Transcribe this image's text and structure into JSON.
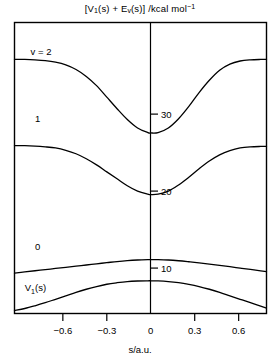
{
  "chart_data": {
    "type": "line",
    "title_parts": {
      "open_bracket": "[V",
      "sub1": "1",
      "mid": "(s) + E",
      "sub2": "v",
      "close": "(s)] /kcal mol",
      "sup": "−1"
    },
    "xlabel": "s/a.u.",
    "ylabel": "",
    "xlim": [
      -0.93,
      0.79
    ],
    "ylim": [
      4.1,
      41.9
    ],
    "grid": false,
    "legend_position": "inline-left-labels",
    "xticks": [
      -0.6,
      -0.3,
      0,
      0.3,
      0.6
    ],
    "xticklabels": [
      "−0.6",
      "−0.3",
      "0",
      "0.3",
      "0.6"
    ],
    "yticks": [
      10,
      20,
      30
    ],
    "yticklabels": [
      "10",
      "20",
      "30"
    ],
    "series": [
      {
        "name": "v = 2",
        "label": "v = 2",
        "label_x": -0.82,
        "label_y": 37.7,
        "x": [
          -0.93,
          -0.86,
          -0.79,
          -0.72,
          -0.65,
          -0.58,
          -0.51,
          -0.44,
          -0.37,
          -0.3,
          -0.23,
          -0.16,
          -0.09,
          -0.02,
          0.0,
          0.05,
          0.12,
          0.19,
          0.26,
          0.33,
          0.4,
          0.47,
          0.54,
          0.61,
          0.68,
          0.75,
          0.79
        ],
        "y": [
          37.1,
          37.1,
          37.05,
          36.95,
          36.75,
          36.4,
          35.8,
          34.9,
          33.7,
          32.2,
          30.7,
          29.3,
          28.2,
          27.6,
          27.55,
          27.6,
          28.2,
          29.4,
          31.0,
          32.8,
          34.4,
          35.7,
          36.5,
          36.9,
          37.05,
          37.1,
          37.1
        ]
      },
      {
        "name": "v = 1",
        "label": "1",
        "label_x": -0.79,
        "label_y": 29.0,
        "x": [
          -0.93,
          -0.86,
          -0.79,
          -0.72,
          -0.65,
          -0.58,
          -0.51,
          -0.44,
          -0.37,
          -0.3,
          -0.23,
          -0.16,
          -0.09,
          -0.02,
          0.0,
          0.05,
          0.12,
          0.19,
          0.26,
          0.33,
          0.4,
          0.47,
          0.54,
          0.61,
          0.68,
          0.75,
          0.79
        ],
        "y": [
          25.9,
          25.9,
          25.85,
          25.75,
          25.6,
          25.3,
          24.85,
          24.2,
          23.4,
          22.5,
          21.6,
          20.7,
          20.0,
          19.6,
          19.55,
          19.6,
          20.0,
          20.8,
          21.8,
          22.9,
          23.9,
          24.7,
          25.25,
          25.6,
          25.75,
          25.8,
          25.8
        ]
      },
      {
        "name": "v = 0",
        "label": "0",
        "label_x": -0.79,
        "label_y": 12.3,
        "x": [
          -0.93,
          -0.86,
          -0.79,
          -0.72,
          -0.65,
          -0.58,
          -0.51,
          -0.44,
          -0.37,
          -0.3,
          -0.23,
          -0.16,
          -0.09,
          -0.02,
          0.0,
          0.05,
          0.12,
          0.19,
          0.26,
          0.33,
          0.4,
          0.47,
          0.54,
          0.61,
          0.68,
          0.75,
          0.79
        ],
        "y": [
          9.35,
          9.5,
          9.65,
          9.8,
          9.95,
          10.1,
          10.25,
          10.4,
          10.55,
          10.7,
          10.85,
          10.97,
          11.05,
          11.1,
          11.1,
          11.1,
          11.05,
          10.95,
          10.82,
          10.68,
          10.52,
          10.35,
          10.18,
          10.0,
          9.82,
          9.65,
          9.55
        ]
      },
      {
        "name": "V1(s)",
        "label": "V1(s)",
        "label_parts": {
          "pre": "V",
          "sub": "1",
          "post": "(s)"
        },
        "label_x": -0.86,
        "label_y": 7.0,
        "x": [
          -0.93,
          -0.86,
          -0.79,
          -0.72,
          -0.65,
          -0.58,
          -0.51,
          -0.44,
          -0.37,
          -0.3,
          -0.23,
          -0.16,
          -0.09,
          -0.02,
          0.0,
          0.05,
          0.12,
          0.19,
          0.26,
          0.33,
          0.4,
          0.47,
          0.54,
          0.61,
          0.68,
          0.75,
          0.79
        ],
        "y": [
          4.5,
          4.75,
          5.1,
          5.5,
          5.95,
          6.4,
          6.85,
          7.25,
          7.6,
          7.9,
          8.1,
          8.25,
          8.32,
          8.35,
          8.35,
          8.33,
          8.25,
          8.1,
          7.88,
          7.6,
          7.25,
          6.85,
          6.4,
          5.95,
          5.5,
          5.05,
          4.8
        ]
      }
    ]
  }
}
